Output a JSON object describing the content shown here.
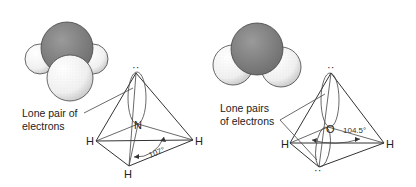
{
  "figure": {
    "panels": [
      {
        "molecule": "ammonia",
        "central_atom": "N",
        "bonded_atoms": [
          "H",
          "H",
          "H"
        ],
        "lone_pair_label_line1": "Lone pair of",
        "lone_pair_label_line2": "electrons",
        "bond_angle": "107°",
        "lone_pair_dots": "··"
      },
      {
        "molecule": "water",
        "central_atom": "O",
        "bonded_atoms": [
          "H",
          "H"
        ],
        "lone_pair_label_line1": "Lone pairs",
        "lone_pair_label_line2": "of electrons",
        "bond_angle": "104.5°",
        "lone_pair_dots_top": "··",
        "lone_pair_dots_bottom": "··"
      }
    ],
    "colors": {
      "central_atom_fill": "#8a8a8a",
      "hydrogen_fill": "#f4f4f4",
      "line": "#333333"
    }
  }
}
